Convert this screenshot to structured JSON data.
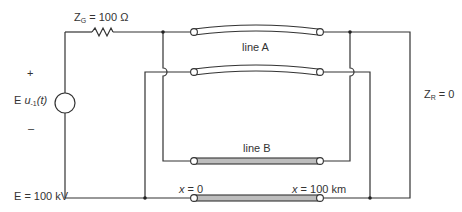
{
  "diagram": {
    "type": "circuit-schematic",
    "labels": {
      "generator_impedance_symbol": "Z",
      "generator_impedance_sub": "G",
      "generator_impedance_value": " = 100 Ω",
      "source_plus": "+",
      "source_minus": "–",
      "source_E": "E",
      "source_u": "u",
      "source_u_sub": "-1",
      "source_u_arg": "(t)",
      "source_value": "E = 100 kV",
      "line_a": "line A",
      "line_b": "line B",
      "receiver_impedance_symbol": "Z",
      "receiver_impedance_sub": "R",
      "receiver_impedance_value": " = 0",
      "x_start_var": "x",
      "x_start_value": " = 0",
      "x_end_var": "x",
      "x_end_value": " = 100 km"
    },
    "colors": {
      "wire": "#333333",
      "line_a_fill": "#ffffff",
      "line_b_fill": "#bdbdbd",
      "text": "#333333"
    }
  }
}
